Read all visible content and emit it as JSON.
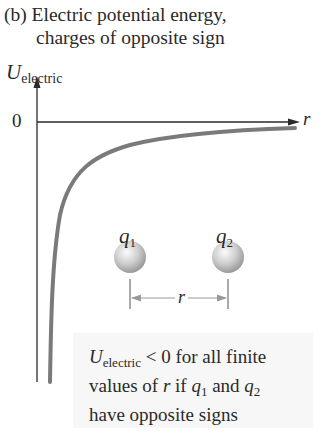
{
  "title": {
    "line1": "(b) Electric potential energy,",
    "line2": "charges of opposite sign"
  },
  "axes": {
    "y_symbol": "U",
    "y_subscript": "electric",
    "zero_label": "0",
    "x_label": "r"
  },
  "charges": {
    "q1": {
      "symbol": "q",
      "subscript": "1"
    },
    "q2": {
      "symbol": "q",
      "subscript": "2"
    },
    "separation_label": "r"
  },
  "annotation": {
    "u_symbol": "U",
    "u_subscript": "electric",
    "line1_rest": " < 0 for all finite",
    "line2_a": "values of ",
    "line2_r": "r",
    "line2_b": " if ",
    "line2_q1": "q",
    "line2_q1_sub": "1",
    "line2_c": " and ",
    "line2_q2": "q",
    "line2_q2_sub": "2",
    "line3": "have opposite signs"
  },
  "colors": {
    "curve": "#7a7a7a",
    "axis": "#2a2a2a",
    "note_bg": "#f7f7f7",
    "sphere": "#c8c8c8"
  }
}
